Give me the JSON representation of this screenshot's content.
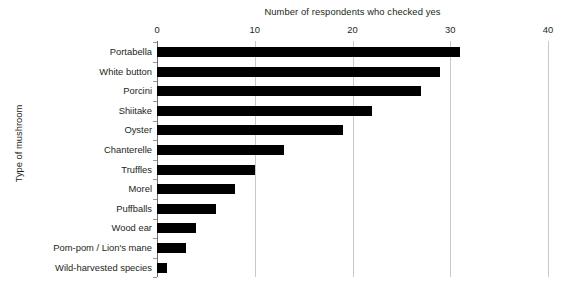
{
  "chart_data": {
    "type": "bar",
    "orientation": "horizontal",
    "title": "",
    "xlabel": "Number of respondents who checked yes",
    "ylabel": "Type of mushroom",
    "xlim": [
      0,
      40
    ],
    "xticks": [
      0,
      10,
      20,
      30,
      40
    ],
    "xtick_labels": [
      "0",
      "10",
      "20",
      "30",
      "40"
    ],
    "grid": "vertical",
    "legend": "none",
    "bar_color": "#000000",
    "gridline_color": "#c9c9c9",
    "axis_color": "#6d6d6d",
    "categories": [
      "Portabella",
      "White button",
      "Porcini",
      "Shiitake",
      "Oyster",
      "Chanterelle",
      "Truffles",
      "Morel",
      "Puffballs",
      "Wood ear",
      "Pom-pom / Lion's mane",
      "Wild-harvested species"
    ],
    "values": [
      31,
      29,
      27,
      22,
      19,
      13,
      10,
      8,
      6,
      4,
      3,
      1
    ]
  }
}
